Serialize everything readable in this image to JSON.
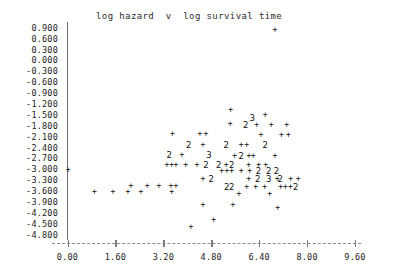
{
  "chart_data": {
    "type": "scatter",
    "title": "log hazard  v  log survival time",
    "xlabel": "",
    "ylabel": "",
    "xlim": [
      0.0,
      9.6
    ],
    "ylim": [
      -4.8,
      0.9
    ],
    "grid": false,
    "legend": null,
    "point_glyph": "+",
    "overplot_note": "Digits (2, 3) mark positions where that many points coincide.",
    "x_ticks": [
      "0.00",
      "1.60",
      "3.20",
      "4.80",
      "6.40",
      "8.00",
      "9.60"
    ],
    "x_tick_values": [
      0.0,
      1.6,
      3.2,
      4.8,
      6.4,
      8.0,
      9.6
    ],
    "y_ticks": [
      "0.900",
      "0.600",
      "0.300",
      "0.000",
      "-0.300",
      "-0.600",
      "-0.900",
      "-1.200",
      "-1.500",
      "-1.800",
      "-2.100",
      "-2.400",
      "-2.700",
      "-3.000",
      "-3.300",
      "-3.600",
      "-3.900",
      "-4.200",
      "-4.500",
      "-4.800"
    ],
    "y_tick_values": [
      0.9,
      0.6,
      0.3,
      0.0,
      -0.3,
      -0.6,
      -0.9,
      -1.2,
      -1.5,
      -1.8,
      -2.1,
      -2.4,
      -2.7,
      -3.0,
      -3.3,
      -3.6,
      -3.9,
      -4.2,
      -4.5,
      -4.8
    ],
    "points": [
      {
        "x": 6.93,
        "y": 0.84,
        "n": 1
      },
      {
        "x": 5.45,
        "y": -1.35,
        "n": 1
      },
      {
        "x": 6.6,
        "y": -1.5,
        "n": 1
      },
      {
        "x": 6.17,
        "y": -1.58,
        "n": 3
      },
      {
        "x": 5.43,
        "y": -1.73,
        "n": 1
      },
      {
        "x": 5.95,
        "y": -1.78,
        "n": 2
      },
      {
        "x": 6.32,
        "y": -1.78,
        "n": 1
      },
      {
        "x": 6.8,
        "y": -1.78,
        "n": 1
      },
      {
        "x": 7.32,
        "y": -1.78,
        "n": 1
      },
      {
        "x": 3.5,
        "y": -2.02,
        "n": 1
      },
      {
        "x": 4.42,
        "y": -2.02,
        "n": 1
      },
      {
        "x": 4.62,
        "y": -2.02,
        "n": 1
      },
      {
        "x": 6.46,
        "y": -2.05,
        "n": 1
      },
      {
        "x": 7.14,
        "y": -2.05,
        "n": 1
      },
      {
        "x": 7.38,
        "y": -2.05,
        "n": 1
      },
      {
        "x": 4.05,
        "y": -2.32,
        "n": 2
      },
      {
        "x": 4.52,
        "y": -2.32,
        "n": 1
      },
      {
        "x": 5.3,
        "y": -2.32,
        "n": 2
      },
      {
        "x": 5.8,
        "y": -2.32,
        "n": 1
      },
      {
        "x": 5.98,
        "y": -2.32,
        "n": 1
      },
      {
        "x": 6.6,
        "y": -2.32,
        "n": 2
      },
      {
        "x": 3.4,
        "y": -2.6,
        "n": 2
      },
      {
        "x": 3.82,
        "y": -2.6,
        "n": 1
      },
      {
        "x": 4.72,
        "y": -2.6,
        "n": 3
      },
      {
        "x": 5.58,
        "y": -2.62,
        "n": 1
      },
      {
        "x": 5.8,
        "y": -2.62,
        "n": 2
      },
      {
        "x": 6.06,
        "y": -2.62,
        "n": 1
      },
      {
        "x": 6.2,
        "y": -2.62,
        "n": 1
      },
      {
        "x": 6.93,
        "y": -2.62,
        "n": 1
      },
      {
        "x": 3.32,
        "y": -2.88,
        "n": 1
      },
      {
        "x": 3.48,
        "y": -2.88,
        "n": 1
      },
      {
        "x": 3.62,
        "y": -2.88,
        "n": 1
      },
      {
        "x": 3.95,
        "y": -2.88,
        "n": 1
      },
      {
        "x": 4.32,
        "y": -2.88,
        "n": 1
      },
      {
        "x": 4.62,
        "y": -2.88,
        "n": 2
      },
      {
        "x": 5.05,
        "y": -2.88,
        "n": 2
      },
      {
        "x": 5.3,
        "y": -2.88,
        "n": 1
      },
      {
        "x": 5.48,
        "y": -2.88,
        "n": 2
      },
      {
        "x": 6.05,
        "y": -2.88,
        "n": 1
      },
      {
        "x": 6.38,
        "y": -2.88,
        "n": 1
      },
      {
        "x": 6.62,
        "y": -2.88,
        "n": 1
      },
      {
        "x": 0.02,
        "y": -3.02,
        "n": 1
      },
      {
        "x": 5.15,
        "y": -3.05,
        "n": 1
      },
      {
        "x": 5.32,
        "y": -3.05,
        "n": 1
      },
      {
        "x": 5.48,
        "y": -3.05,
        "n": 1
      },
      {
        "x": 5.8,
        "y": -3.05,
        "n": 1
      },
      {
        "x": 6.08,
        "y": -3.05,
        "n": 1
      },
      {
        "x": 6.38,
        "y": -3.05,
        "n": 2
      },
      {
        "x": 6.72,
        "y": -3.05,
        "n": 2
      },
      {
        "x": 6.98,
        "y": -3.05,
        "n": 2
      },
      {
        "x": 4.52,
        "y": -3.26,
        "n": 1
      },
      {
        "x": 4.8,
        "y": -3.26,
        "n": 2
      },
      {
        "x": 6.05,
        "y": -3.26,
        "n": 1
      },
      {
        "x": 6.35,
        "y": -3.26,
        "n": 2
      },
      {
        "x": 6.72,
        "y": -3.26,
        "n": 3
      },
      {
        "x": 7.0,
        "y": -3.26,
        "n": 1
      },
      {
        "x": 7.1,
        "y": -3.26,
        "n": 2
      },
      {
        "x": 7.45,
        "y": -3.26,
        "n": 1
      },
      {
        "x": 7.7,
        "y": -3.26,
        "n": 1
      },
      {
        "x": 2.12,
        "y": -3.46,
        "n": 1
      },
      {
        "x": 2.66,
        "y": -3.46,
        "n": 1
      },
      {
        "x": 3.05,
        "y": -3.46,
        "n": 1
      },
      {
        "x": 3.45,
        "y": -3.46,
        "n": 1
      },
      {
        "x": 3.62,
        "y": -3.46,
        "n": 1
      },
      {
        "x": 5.32,
        "y": -3.48,
        "n": 2
      },
      {
        "x": 5.48,
        "y": -3.48,
        "n": 2
      },
      {
        "x": 5.98,
        "y": -3.48,
        "n": 1
      },
      {
        "x": 6.28,
        "y": -3.48,
        "n": 1
      },
      {
        "x": 6.58,
        "y": -3.48,
        "n": 1
      },
      {
        "x": 7.12,
        "y": -3.48,
        "n": 1
      },
      {
        "x": 7.28,
        "y": -3.48,
        "n": 1
      },
      {
        "x": 7.44,
        "y": -3.48,
        "n": 1
      },
      {
        "x": 7.62,
        "y": -3.48,
        "n": 2
      },
      {
        "x": 0.9,
        "y": -3.62,
        "n": 1
      },
      {
        "x": 1.52,
        "y": -3.62,
        "n": 1
      },
      {
        "x": 2.02,
        "y": -3.62,
        "n": 1
      },
      {
        "x": 2.45,
        "y": -3.62,
        "n": 1
      },
      {
        "x": 3.48,
        "y": -3.62,
        "n": 1
      },
      {
        "x": 5.72,
        "y": -3.68,
        "n": 1
      },
      {
        "x": 6.75,
        "y": -3.68,
        "n": 1
      },
      {
        "x": 4.52,
        "y": -3.98,
        "n": 1
      },
      {
        "x": 5.52,
        "y": -3.98,
        "n": 1
      },
      {
        "x": 7.02,
        "y": -4.05,
        "n": 1
      },
      {
        "x": 4.88,
        "y": -4.38,
        "n": 1
      },
      {
        "x": 4.12,
        "y": -4.58,
        "n": 1
      }
    ]
  }
}
